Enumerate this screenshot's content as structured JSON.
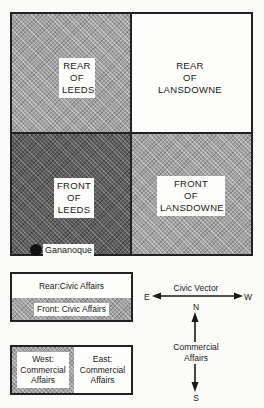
{
  "map": {
    "cells": {
      "rear_of_leeds": {
        "lines": [
          "REAR",
          "OF",
          "LEEDS"
        ],
        "shade": "medium"
      },
      "rear_of_lansdowne": {
        "lines": [
          "REAR",
          "OF",
          "LANSDOWNE"
        ],
        "shade": "white"
      },
      "front_of_leeds": {
        "lines": [
          "FRONT",
          "OF",
          "LEEDS"
        ],
        "shade": "dark"
      },
      "front_of_lansdowne": {
        "lines": [
          "FRONT",
          "OF",
          "LANSDOWNE"
        ],
        "shade": "medium"
      }
    },
    "town_marker": {
      "label": "Gananoque"
    }
  },
  "legend_civic": {
    "rear_label": "Rear:Civic Affairs",
    "front_label": "Front: Civic Affairs"
  },
  "legend_commercial": {
    "west_lines": [
      "West:",
      "Commercial",
      "Affairs"
    ],
    "east_lines": [
      "East:",
      "Commercial",
      "Affairs"
    ]
  },
  "compass": {
    "horizontal_label": "Civic Vector",
    "left": "E",
    "right": "W",
    "top": "N",
    "bottom": "S",
    "vertical_label_lines": [
      "Commercial",
      "Affairs"
    ]
  },
  "colors": {
    "line": "#222222",
    "dark_shade": "#5e5e5e",
    "medium_shade": "#a2a2a2",
    "background": "#fbfbf9"
  }
}
